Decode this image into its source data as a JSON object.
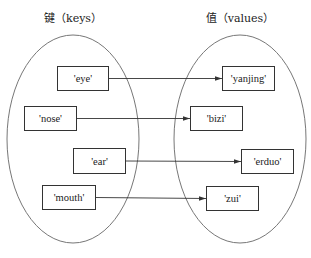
{
  "titles": {
    "keys": "键（keys）",
    "values": "值（values）"
  },
  "colors": {
    "stroke": "#333333",
    "ellipse": "#777777",
    "text": "#222222",
    "background": "#ffffff"
  },
  "ellipses": {
    "keys": {
      "cx": 73,
      "cy": 139,
      "rx": 66,
      "ry": 104
    },
    "values": {
      "cx": 240,
      "cy": 139,
      "rx": 66,
      "ry": 104
    }
  },
  "keys": [
    {
      "label": "'eye'",
      "x": 57,
      "y": 66,
      "w": 52,
      "h": 25
    },
    {
      "label": "'nose'",
      "x": 24,
      "y": 106,
      "w": 53,
      "h": 25
    },
    {
      "label": "'ear'",
      "x": 73,
      "y": 148,
      "w": 53,
      "h": 26
    },
    {
      "label": "'mouth'",
      "x": 42,
      "y": 185,
      "w": 54,
      "h": 25
    }
  ],
  "values": [
    {
      "label": "'yanjing'",
      "x": 222,
      "y": 66,
      "w": 53,
      "h": 25
    },
    {
      "label": "'bizi'",
      "x": 190,
      "y": 106,
      "w": 53,
      "h": 25
    },
    {
      "label": "'erduo'",
      "x": 241,
      "y": 149,
      "w": 53,
      "h": 25
    },
    {
      "label": "'zui'",
      "x": 206,
      "y": 186,
      "w": 53,
      "h": 25
    }
  ],
  "mappings": [
    {
      "from": "'eye'",
      "to": "'yanjing'"
    },
    {
      "from": "'nose'",
      "to": "'bizi'"
    },
    {
      "from": "'ear'",
      "to": "'erduo'"
    },
    {
      "from": "'mouth'",
      "to": "'zui'"
    }
  ]
}
